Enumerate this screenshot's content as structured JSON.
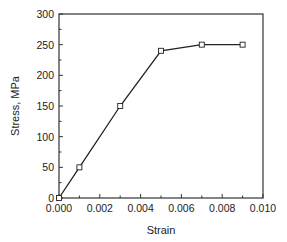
{
  "chart_data": {
    "type": "line",
    "title": "",
    "xlabel": "Strain",
    "ylabel": "Stress, MPa",
    "xlim": [
      0,
      0.01
    ],
    "ylim": [
      0,
      300
    ],
    "grid": false,
    "legend": null,
    "x_ticks": [
      "0.000",
      "0.002",
      "0.004",
      "0.006",
      "0.008",
      "0.010"
    ],
    "y_ticks": [
      "0",
      "50",
      "100",
      "150",
      "200",
      "250",
      "300"
    ],
    "series": [
      {
        "name": "Stress-strain",
        "marker": "open-square",
        "color": "#222222",
        "x": [
          0.0,
          0.001,
          0.003,
          0.005,
          0.007,
          0.009
        ],
        "y": [
          0,
          50,
          150,
          240,
          250,
          250
        ]
      }
    ]
  }
}
